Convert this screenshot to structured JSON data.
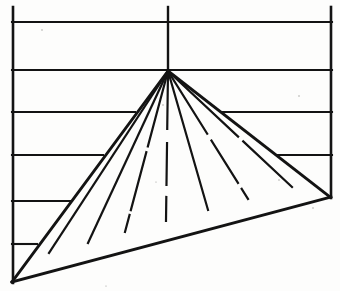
{
  "figure": {
    "title": "Triangle fan over horizontal grid",
    "caption": "",
    "background_color": "#fdfdfc",
    "ink_color": "#131313",
    "canvas": {
      "width": 340,
      "height": 291
    }
  },
  "chart_data": {
    "type": "diagram",
    "title": "Triangle fan over horizontal grid",
    "xlabel": "",
    "ylabel": "",
    "grid": true,
    "legend": "none",
    "xlim": [
      0,
      340
    ],
    "ylim": [
      0,
      291
    ],
    "vertices": {
      "apex": [
        168,
        71
      ],
      "base_left": [
        12,
        282
      ],
      "base_right": [
        330,
        197
      ]
    },
    "frame": {
      "left_vertical": {
        "x": 12,
        "y_top": 7,
        "y_bottom": 282
      },
      "right_vertical": {
        "x": 332,
        "y_top": 7,
        "y_bottom": 197
      },
      "center_vertical": {
        "x": 168,
        "y_top": 7,
        "y_bottom": 71
      }
    },
    "horizontal_grid_lines": [
      {
        "y": 22,
        "x_start": 12,
        "x_end": 332,
        "breaks": []
      },
      {
        "y": 70,
        "x_start": 12,
        "x_end": 332,
        "breaks": []
      },
      {
        "y": 112,
        "x_start": 12,
        "x_end": 332,
        "breaks": [
          [
            135,
            222
          ]
        ]
      },
      {
        "y": 155,
        "x_start": 12,
        "x_end": 332,
        "breaks": [
          [
            103,
            278
          ]
        ]
      },
      {
        "y": 201,
        "x_start": 12,
        "x_end": 332,
        "breaks": [
          [
            72,
            332
          ]
        ]
      },
      {
        "y": 244,
        "x_start": 12,
        "x_end": 332,
        "breaks": [
          [
            37,
            332
          ]
        ]
      }
    ],
    "radial_lines": [
      {
        "from": [
          168,
          71
        ],
        "to": [
          49,
          253
        ],
        "label": "r1"
      },
      {
        "from": [
          168,
          71
        ],
        "to": [
          88,
          243
        ],
        "label": "r2"
      },
      {
        "from": [
          168,
          71
        ],
        "to": [
          125,
          232
        ],
        "label": "r3"
      },
      {
        "from": [
          168,
          71
        ],
        "to": [
          166,
          221
        ],
        "label": "r4"
      },
      {
        "from": [
          168,
          71
        ],
        "to": [
          208,
          210
        ],
        "label": "r5"
      },
      {
        "from": [
          168,
          71
        ],
        "to": [
          248,
          199
        ],
        "label": "r6"
      },
      {
        "from": [
          168,
          71
        ],
        "to": [
          292,
          187
        ],
        "label": "r7"
      }
    ],
    "base_intersections_x": [
      49,
      88,
      125,
      166,
      208,
      248,
      292
    ],
    "base_slope_note": "Base runs from (12,282) up-right to (330,197)"
  }
}
